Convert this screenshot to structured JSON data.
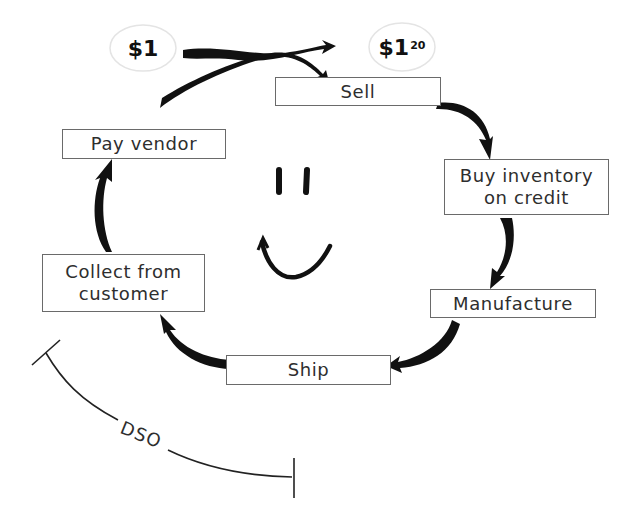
{
  "diagram": {
    "type": "cash-conversion-cycle",
    "start_amount": {
      "main": "$1",
      "superscript": ""
    },
    "end_amount": {
      "main": "$1",
      "superscript": "20"
    },
    "steps": [
      {
        "id": "sell",
        "lines": [
          "Sell"
        ]
      },
      {
        "id": "buy",
        "lines": [
          "Buy inventory",
          "on credit"
        ]
      },
      {
        "id": "manufacture",
        "lines": [
          "Manufacture"
        ]
      },
      {
        "id": "ship",
        "lines": [
          "Ship"
        ]
      },
      {
        "id": "collect",
        "lines": [
          "Collect from",
          "customer"
        ]
      },
      {
        "id": "pay",
        "lines": [
          "Pay vendor"
        ]
      }
    ],
    "cycle_order": [
      "sell",
      "buy",
      "manufacture",
      "ship",
      "collect",
      "pay",
      "sell"
    ],
    "span_label": "DSO",
    "center_icon": "smiley-face-icon",
    "colors": {
      "arrow": "#111111",
      "box_border": "#6a6a6a",
      "text": "#2e2e2e",
      "money_ellipse": "#e4e4e4",
      "background": "#ffffff"
    }
  }
}
